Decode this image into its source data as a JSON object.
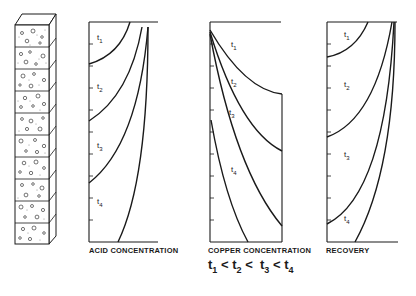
{
  "diagram": {
    "column": {
      "segments": 10,
      "description": "packed ore column"
    },
    "panels": [
      {
        "id": "acid",
        "label": "ACID CONCENTRATION",
        "curve_labels": [
          "t1",
          "t2",
          "t3",
          "t4"
        ]
      },
      {
        "id": "copper",
        "label": "COPPER CONCENTRATION",
        "curve_labels": [
          "t1",
          "t2",
          "t3",
          "t4"
        ]
      },
      {
        "id": "recovery",
        "label": "RECOVERY",
        "curve_labels": [
          "t1",
          "t2",
          "t3",
          "t4"
        ]
      }
    ],
    "relation": {
      "t1": "t",
      "s1": "1",
      "t2": "t",
      "s2": "2",
      "t3": "t",
      "s3": "3",
      "t4": "t",
      "s4": "4",
      "lt": "<"
    },
    "colors": {
      "line": "#1a1a1a",
      "background": "#ffffff"
    }
  }
}
